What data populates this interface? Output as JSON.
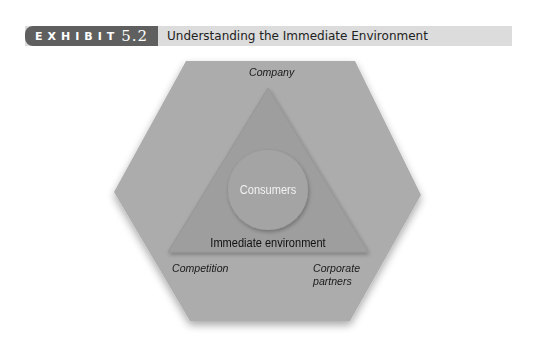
{
  "header": {
    "exhibit_word": "EXHIBIT",
    "exhibit_number": "5.2",
    "title": "Understanding the Immediate Environment"
  },
  "diagram": {
    "outer_hexagon_label_top": "Company",
    "outer_label_bottom_left": "Competition",
    "outer_label_bottom_right_line1": "Corporate",
    "outer_label_bottom_right_line2": "partners",
    "triangle_label": "Immediate environment",
    "circle_label": "Consumers"
  },
  "colors": {
    "header_dark": "#5f5f5f",
    "header_light": "#dcdcdc",
    "hexagon_fill": "#acacac",
    "triangle_fill": "#9e9e9e",
    "circle_fill": "#a4a4a4"
  }
}
